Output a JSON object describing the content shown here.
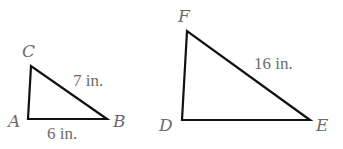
{
  "diagram": {
    "type": "similar-triangles",
    "triangles": [
      {
        "name": "triangle-ABC",
        "vertices": {
          "A": {
            "label": "A",
            "x": 28,
            "y": 119
          },
          "B": {
            "label": "B",
            "x": 107,
            "y": 119
          },
          "C": {
            "label": "C",
            "x": 31,
            "y": 66
          }
        },
        "measurements": [
          {
            "side": "AB",
            "label": "6 in."
          },
          {
            "side": "BC",
            "label": "7 in."
          }
        ]
      },
      {
        "name": "triangle-DEF",
        "vertices": {
          "D": {
            "label": "D",
            "x": 182,
            "y": 120
          },
          "E": {
            "label": "E",
            "x": 310,
            "y": 120
          },
          "F": {
            "label": "F",
            "x": 187,
            "y": 31
          }
        },
        "measurements": [
          {
            "side": "EF",
            "label": "16 in."
          }
        ]
      }
    ],
    "colors": {
      "edge": "#111111",
      "label": "#6b6b6b",
      "background": "#ffffff"
    }
  }
}
